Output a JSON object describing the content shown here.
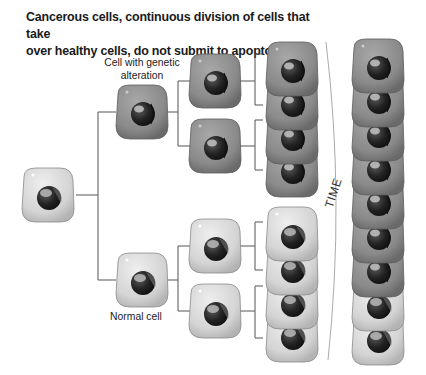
{
  "title": {
    "line1": "Cancerous cells, continuous division of cells that take",
    "line2": "over healthy cells, do not submit to apoptosis."
  },
  "labels": {
    "mutated_line1": "Cell with genetic",
    "mutated_line2": "alteration",
    "normal": "Normal cell",
    "time": "TIME"
  },
  "colors": {
    "cancer_body": "#8a8a8a",
    "cancer_rim": "#6e6e6e",
    "normal_body": "#d6d6d6",
    "normal_rim": "#9a9a9a",
    "nucleus": "#2a2a2a",
    "line": "#555555"
  },
  "cells": {
    "root": {
      "type": "normal"
    },
    "generation1": [
      {
        "type": "cancer",
        "label": "Cell with genetic alteration"
      },
      {
        "type": "normal",
        "label": "Normal cell"
      }
    ],
    "generation2": [
      "cancer",
      "cancer",
      "normal",
      "normal"
    ],
    "generation3": [
      "cancer",
      "cancer",
      "cancer",
      "cancer",
      "normal",
      "normal",
      "normal",
      "normal"
    ],
    "after_time_column": [
      "cancer",
      "cancer",
      "cancer",
      "cancer",
      "cancer",
      "cancer",
      "cancer",
      "normal",
      "normal"
    ]
  }
}
